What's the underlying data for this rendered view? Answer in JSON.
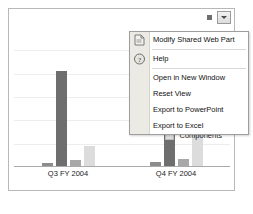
{
  "webpart": {
    "dropdown_button": "web-part-menu",
    "menu_dot": "·"
  },
  "menu": {
    "items": [
      {
        "label": "Modify Shared Web Part",
        "icon": "modify-webpart-icon",
        "separator_after": true
      },
      {
        "label": "Help",
        "icon": "help-icon",
        "separator_after": true
      },
      {
        "label": "Open in New Window",
        "icon": "",
        "separator_after": false
      },
      {
        "label": "Reset View",
        "icon": "",
        "separator_after": false
      },
      {
        "label": "Export to PowerPoint",
        "icon": "",
        "separator_after": false
      },
      {
        "label": "Export to Excel",
        "icon": "",
        "separator_after": false
      }
    ]
  },
  "legend": {
    "entries": [
      {
        "label": "Components",
        "color": "#dcdcdc"
      }
    ]
  },
  "colors": {
    "bar_dark": "#6e6e6e",
    "bar_mid": "#a8a8a8",
    "bar_light": "#dcdcdc",
    "border": "#b8b8b8",
    "gridline": "#ededed",
    "axis": "#a9a9a9"
  },
  "chart_data": {
    "type": "bar",
    "title": "",
    "xlabel": "",
    "ylabel": "",
    "grid": true,
    "legend_position": "right",
    "categories": [
      "Q3 FY 2004",
      "Q4 FY 2004"
    ],
    "ylim": [
      0,
      100
    ],
    "series": [
      {
        "name": "Series 1",
        "color": "#8c8c8c",
        "values": [
          2,
          3
        ]
      },
      {
        "name": "Series 2",
        "color": "#6e6e6e",
        "values": [
          68,
          88
        ]
      },
      {
        "name": "Series 3",
        "color": "#a8a8a8",
        "values": [
          4,
          5
        ]
      },
      {
        "name": "Components",
        "color": "#dcdcdc",
        "values": [
          14,
          33
        ]
      }
    ]
  }
}
